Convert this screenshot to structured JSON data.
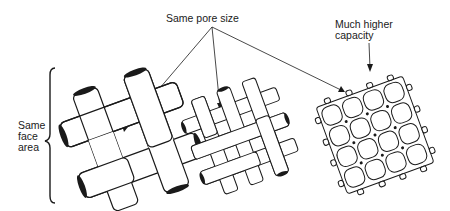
{
  "diagram": {
    "labels": {
      "same_pore_size": "Same pore size",
      "much_higher_capacity_line1": "Much higher",
      "much_higher_capacity_line2": "capacity",
      "same_face_area_line1": "Same",
      "same_face_area_line2": "face",
      "same_face_area_line3": "area"
    },
    "meshes": [
      {
        "name": "coarse-weave",
        "description": "Thick strand plain weave"
      },
      {
        "name": "medium-weave",
        "description": "Thin strand plain weave"
      },
      {
        "name": "fine-mesh",
        "description": "Fine fiber mesh, much higher capacity"
      }
    ],
    "colors": {
      "ink": "#1a1a1a",
      "background": "#ffffff"
    }
  }
}
